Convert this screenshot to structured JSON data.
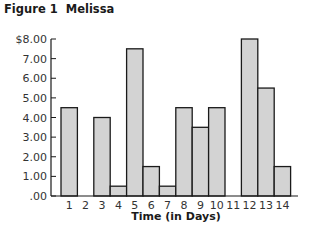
{
  "figure": {
    "label": "Figure 1",
    "name": "Melissa"
  },
  "chart_data": {
    "type": "bar",
    "title": "Figure 1  Melissa",
    "xlabel": "Time (in Days)",
    "ylabel": "",
    "categories": [
      "1",
      "2",
      "3",
      "4",
      "5",
      "6",
      "7",
      "8",
      "9",
      "10",
      "11",
      "12",
      "13",
      "14"
    ],
    "values": [
      4.5,
      0,
      4.0,
      0.5,
      7.5,
      1.5,
      0.5,
      4.5,
      3.5,
      4.5,
      0,
      8.0,
      5.5,
      1.5
    ],
    "ylim": [
      0,
      8
    ],
    "yticks": [
      ".00",
      "1.00",
      "2.00",
      "3.00",
      "4.00",
      "5.00",
      "6.00",
      "7.00",
      "$8.00"
    ],
    "grid": false,
    "bar_fill": "#d3d3d3",
    "bar_stroke": "#1a1a1a"
  }
}
